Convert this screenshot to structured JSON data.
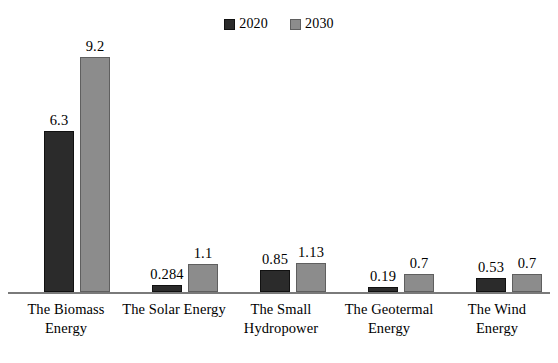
{
  "legend": {
    "position": "top-center",
    "entries": [
      {
        "label": "2020",
        "color": "#2b2b2b",
        "marker": "filled-square-icon"
      },
      {
        "label": "2030",
        "color": "#8c8c8c",
        "marker": "filled-square-icon"
      }
    ]
  },
  "axis": {
    "baseline_visible": true,
    "y_axis_visible": false,
    "grid": false,
    "y_tick_labels": [],
    "x_tick_labels": [
      "The Biomass Energy",
      "The Solar Energy",
      "The Small Hydropower",
      "The Geotermal Energy",
      "The Wind Energy"
    ]
  },
  "chart_data": {
    "type": "bar",
    "title": "",
    "subtitle": "",
    "xlabel": "",
    "ylabel": "",
    "ylim": [
      0,
      9.95
    ],
    "grid": false,
    "legend_position": "top-center",
    "categories": [
      "The Biomass Energy",
      "The Solar Energy",
      "The Small Hydropower",
      "The Geotermal Energy",
      "The Wind Energy"
    ],
    "category_lines": [
      [
        "The Biomass",
        "Energy"
      ],
      [
        "The Solar Energy"
      ],
      [
        "The Small",
        "Hydropower"
      ],
      [
        "The Geotermal",
        "Energy"
      ],
      [
        "The Wind",
        "Energy"
      ]
    ],
    "series": [
      {
        "name": "2020",
        "color": "#2b2b2b",
        "values": [
          6.3,
          0.284,
          0.85,
          0.19,
          0.53
        ],
        "labels": [
          "6.3",
          "0.284",
          "0.85",
          "0.19",
          "0.53"
        ]
      },
      {
        "name": "2030",
        "color": "#8c8c8c",
        "values": [
          9.2,
          1.1,
          1.13,
          0.7,
          0.7
        ],
        "labels": [
          "9.2",
          "1.1",
          "1.13",
          "0.7",
          "0.7"
        ]
      }
    ],
    "annotations": []
  },
  "layout": {
    "bar_width_px": 30,
    "bar_gap_px": 6,
    "group_centers_px": [
      66,
      173,
      281,
      389,
      497
    ],
    "plot_height_px": 252,
    "px_per_unit": 25.55
  }
}
